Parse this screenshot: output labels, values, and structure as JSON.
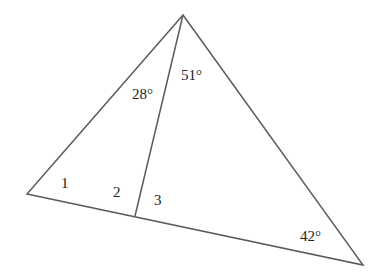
{
  "diagram": {
    "type": "triangle-with-cevian",
    "stroke_color": "#5a5a5a",
    "vertices": {
      "apex": [
        183,
        15
      ],
      "left": [
        27,
        194
      ],
      "right": [
        363,
        265
      ],
      "foot": [
        135,
        216
      ]
    },
    "labels": {
      "angle_apex_left": "28°",
      "angle_apex_right": "51°",
      "angle_1": "1",
      "angle_2": "2",
      "angle_3": "3",
      "angle_right": "42°"
    }
  }
}
